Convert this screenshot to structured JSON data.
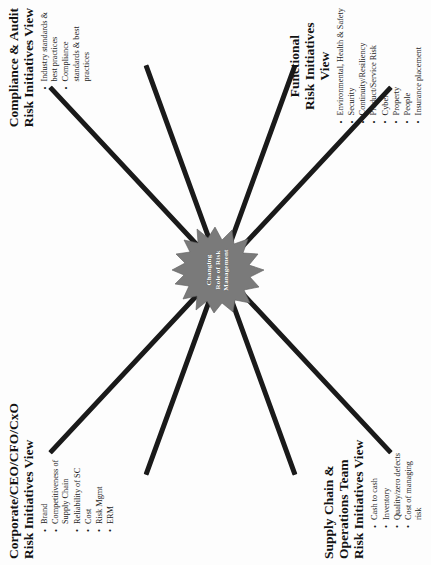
{
  "diagram": {
    "type": "x-shaped-convergence",
    "center": {
      "label_line1": "Changing",
      "label_line2": "Role of Risk",
      "label_line3": "Management",
      "shape": "starburst",
      "fill_color": "#7a7a7a",
      "text_color": "#ffffff"
    },
    "arm_color": "#1a1a1a",
    "quadrants": [
      {
        "id": "corporate",
        "heading_line1": "Corporate/CEO/CFO/CxO",
        "heading_line2": "Risk Initiatives View",
        "bullets": [
          "Brand",
          "Competitiveness of\nSupply Chain",
          "Reliability of SC",
          "Cost",
          "Risk Mgmt",
          "ERM"
        ]
      },
      {
        "id": "compliance",
        "heading_line1": "Compliance & Audit",
        "heading_line2": "Risk Initiatives View",
        "bullets": [
          "Industry standards &\nbest practices",
          "Compliance\nstandards & best\npractices"
        ]
      },
      {
        "id": "supply-chain",
        "heading_line1": "Supply Chain &",
        "heading_line2": "Operations Team",
        "heading_line3": "Risk Initiatives View",
        "bullets": [
          "Cash to cash",
          "Inventory",
          "Quality/zero defects",
          "Cost of managing\nrisk"
        ]
      },
      {
        "id": "functional",
        "heading_line1": "Functional",
        "heading_line2": "Risk Initiatives",
        "heading_line3": "View",
        "bullets": [
          "Environmental, Health & Safety",
          "Security",
          "Continuity/Resiliency",
          "Product/Service Risk",
          "Cyber",
          "Property",
          "People",
          "Insurance placement"
        ]
      }
    ]
  }
}
